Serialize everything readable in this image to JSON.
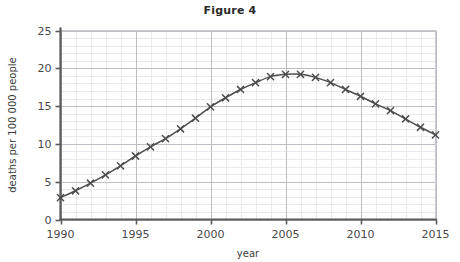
{
  "figure": {
    "title": "Figure 4"
  },
  "chart_data": {
    "type": "line",
    "title": "Figure 4",
    "xlabel": "year",
    "ylabel": "deaths per 100 000 people",
    "xlim": [
      1990,
      2015
    ],
    "ylim": [
      0,
      25
    ],
    "x_major_ticks": [
      1990,
      1995,
      2000,
      2005,
      2010,
      2015
    ],
    "x_major_tick_labels": [
      "1990",
      "1995",
      "2000",
      "2005",
      "2010",
      "2015"
    ],
    "y_major_ticks": [
      0,
      5,
      10,
      15,
      20,
      25
    ],
    "y_major_tick_labels": [
      "0",
      "5",
      "10",
      "15",
      "20",
      "25"
    ],
    "x_minor_step": 1,
    "y_minor_step": 1,
    "grid": true,
    "legend": false,
    "marker": "x",
    "line_color": "#4d4d4d",
    "grid_major_color": "#b9b9bf",
    "grid_minor_color": "#e4e4ea",
    "axis_color": "#5a5a5a",
    "x": [
      1990,
      1991,
      1992,
      1993,
      1994,
      1995,
      1996,
      1997,
      1998,
      1999,
      2000,
      2001,
      2002,
      2003,
      2004,
      2005,
      2006,
      2007,
      2008,
      2009,
      2010,
      2011,
      2012,
      2013,
      2014,
      2015
    ],
    "values": [
      2.9,
      3.8,
      4.8,
      5.9,
      7.1,
      8.4,
      9.6,
      10.7,
      12.0,
      13.4,
      14.9,
      16.1,
      17.2,
      18.1,
      18.9,
      19.2,
      19.2,
      18.8,
      18.1,
      17.2,
      16.3,
      15.3,
      14.4,
      13.3,
      12.2,
      11.2
    ]
  }
}
